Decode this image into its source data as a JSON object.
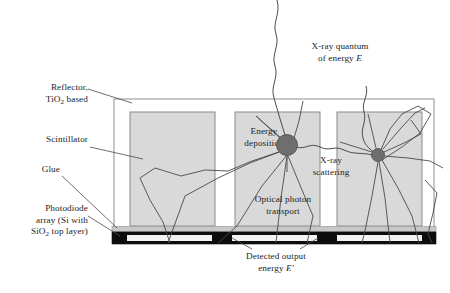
{
  "figure": {
    "type": "cross-section-diagram"
  },
  "colors": {
    "scintillator_fill": "#d9d9d9",
    "scintillator_stroke": "#8a8a8a",
    "reflector_stroke": "#8d8d8d",
    "glue_fill": "#c8c8c8",
    "photodiode_fill": "#0d0d0d",
    "photodiode_pixel_fill": "#f2f2f2",
    "interaction_dot": "#6e6e6e",
    "ray_stroke": "#4a4a4a",
    "leader_stroke": "#4a4a4a",
    "background": "#ffffff"
  },
  "labels": {
    "reflector": {
      "line1": "Reflector,",
      "line2_pre": "TiO",
      "line2_sub": "2",
      "line2_post": " based"
    },
    "scintillator": "Scintillator",
    "glue": "Glue",
    "photodiode": {
      "line1": "Photodiode",
      "line2": "array (Si with",
      "line3_pre": "SiO",
      "line3_sub": "2",
      "line3_post": " top layer)"
    },
    "xray_quantum": {
      "line1": "X-ray quantum",
      "line2_pre": "of energy ",
      "line2_sym": "E"
    },
    "energy_deposition": {
      "line1": "Energy",
      "line2": "deposition"
    },
    "xray_scattering": {
      "line1": "X-ray",
      "line2": "scattering"
    },
    "optical_photon_transport": {
      "line1": "Optical photon",
      "line2": "transport"
    },
    "detected_output": {
      "line1": "Detected output",
      "line2_pre": "energy ",
      "line2_sym": "E′"
    }
  },
  "geometry": {
    "reflector_box": {
      "x": 114,
      "y": 99,
      "w": 320,
      "h": 132
    },
    "scintillator_blocks": [
      {
        "x": 130,
        "y": 112,
        "w": 85,
        "h": 114
      },
      {
        "x": 235,
        "y": 112,
        "w": 85,
        "h": 114
      },
      {
        "x": 337,
        "y": 112,
        "w": 85,
        "h": 114
      }
    ],
    "glue_layer": {
      "x": 112,
      "y": 227,
      "w": 324,
      "h": 5
    },
    "photodiode_bar": {
      "x": 112,
      "y": 232,
      "w": 324,
      "h": 12
    },
    "photodiode_pixels": [
      {
        "x": 127,
        "y": 235,
        "w": 85,
        "h": 6
      },
      {
        "x": 232,
        "y": 235,
        "w": 85,
        "h": 6
      },
      {
        "x": 337,
        "y": 235,
        "w": 85,
        "h": 6
      }
    ],
    "interaction_points": [
      {
        "cx": 287,
        "cy": 145,
        "r": 10.5,
        "name": "energy-deposition-site"
      },
      {
        "cx": 378,
        "cy": 155,
        "r": 6.5,
        "name": "scatter-site"
      }
    ]
  }
}
